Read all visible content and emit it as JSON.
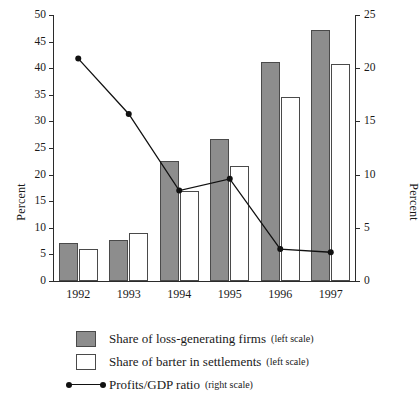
{
  "chart_data": {
    "type": "bar",
    "title": "",
    "subtitle": "",
    "xlabel": "",
    "ylabel": "Percent",
    "y2label": "Percent",
    "categories": [
      "1992",
      "1993",
      "1994",
      "1995",
      "1996",
      "1997"
    ],
    "ylim": [
      0,
      50
    ],
    "yticks": [
      0,
      5,
      10,
      15,
      20,
      25,
      30,
      35,
      40,
      45,
      50
    ],
    "ytick_labels": [
      "0",
      "5",
      "10",
      "15",
      "20",
      "25",
      "30",
      "35",
      "40",
      "45",
      "50"
    ],
    "y2lim": [
      0,
      25
    ],
    "y2ticks": [
      0,
      5,
      10,
      15,
      20,
      25
    ],
    "y2tick_labels": [
      "0",
      "5",
      "10",
      "15",
      "20",
      "25"
    ],
    "grid": false,
    "legend_position": "below",
    "series": [
      {
        "name": "Share of loss-generating firms",
        "scale_note": "(left scale)",
        "axis": "left",
        "kind": "bar",
        "fill": "#8d8d8d",
        "edge": "#4a4a4a",
        "values": [
          7.2,
          7.8,
          22.5,
          26.7,
          41.2,
          47.1
        ]
      },
      {
        "name": "Share of barter in settlements",
        "scale_note": "(left scale)",
        "axis": "left",
        "kind": "bar",
        "fill": "#ffffff",
        "edge": "#4a4a4a",
        "values": [
          6.0,
          9.1,
          17.0,
          21.7,
          34.6,
          40.8
        ]
      },
      {
        "name": "Profits/GDP ratio",
        "scale_note": "(right scale)",
        "axis": "right",
        "kind": "line",
        "fill": "#111111",
        "edge": "#111111",
        "values": [
          20.9,
          15.7,
          8.5,
          9.6,
          3.0,
          2.7
        ]
      }
    ]
  },
  "axes": {
    "left_title": "Percent",
    "right_title": "Percent"
  },
  "legend": {
    "items": [
      {
        "label": "Share of loss-generating firms",
        "scale": "(left scale)",
        "key": "grey-swatch"
      },
      {
        "label": "Share of barter in settlements",
        "scale": "(left scale)",
        "key": "white-swatch"
      },
      {
        "label": "Profits/GDP ratio",
        "scale": "(right scale)",
        "key": "line-marker"
      }
    ]
  }
}
